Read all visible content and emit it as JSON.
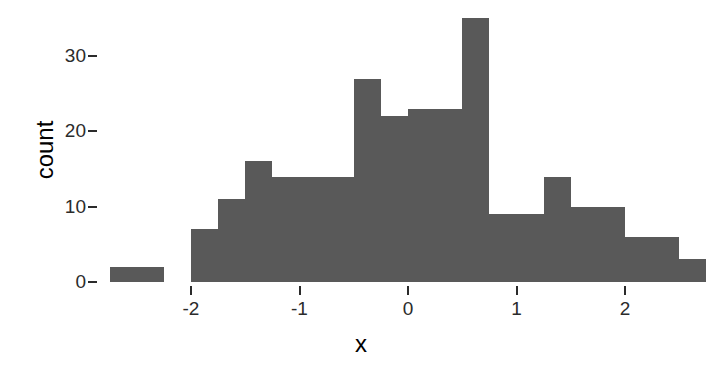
{
  "chart_data": {
    "type": "bar",
    "chart_subtype": "histogram",
    "title": "",
    "subtitle": "",
    "xlabel": "x",
    "ylabel": "count",
    "grid": false,
    "legend": false,
    "legend_position": "none",
    "bar_color": "#595959",
    "text_color": "#2b2b2b",
    "background_color": "#ffffff",
    "binwidth": 0.25,
    "xlim": [
      -2.78,
      2.78
    ],
    "ylim": [
      0,
      35
    ],
    "x_tick_labels": [
      "-2",
      "-1",
      "0",
      "1",
      "2"
    ],
    "x_tick_values": [
      -2,
      -1,
      0,
      1,
      2
    ],
    "y_tick_labels": [
      "0",
      "10",
      "20",
      "30"
    ],
    "y_tick_values": [
      0,
      10,
      20,
      30
    ],
    "bin_left_edges": [
      -2.75,
      -2.5,
      -2.25,
      -2.0,
      -1.75,
      -1.5,
      -1.25,
      -1.0,
      -0.75,
      -0.5,
      -0.25,
      0.0,
      0.25,
      0.5,
      0.75,
      1.0,
      1.25,
      1.5,
      1.75,
      2.0,
      2.25,
      2.5
    ],
    "bin_centers": [
      -2.625,
      -2.375,
      -2.125,
      -1.875,
      -1.625,
      -1.375,
      -1.125,
      -0.875,
      -0.625,
      -0.375,
      -0.125,
      0.125,
      0.375,
      0.625,
      0.875,
      1.125,
      1.375,
      1.625,
      1.875,
      2.125,
      2.375,
      2.625
    ],
    "categories": [
      "-2.75",
      "-2.5",
      "-2.25",
      "-2",
      "-1.75",
      "-1.5",
      "-1.25",
      "-1",
      "-0.75",
      "-0.5",
      "-0.25",
      "0",
      "0.25",
      "0.5",
      "0.75",
      "1",
      "1.25",
      "1.5",
      "1.75",
      "2",
      "2.25",
      "2.5"
    ],
    "values": [
      2,
      2,
      0,
      7,
      11,
      16,
      14,
      14,
      14,
      27,
      22,
      23,
      23,
      35,
      9,
      9,
      14,
      10,
      10,
      6,
      6,
      3
    ]
  },
  "axes": {
    "x_title": "x",
    "y_title": "count"
  }
}
